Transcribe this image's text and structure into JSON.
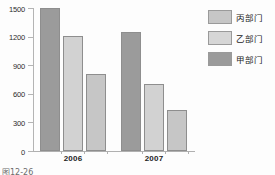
{
  "chart_data": {
    "type": "bar",
    "title": "",
    "xlabel": "",
    "ylabel": "",
    "categories": [
      "2006",
      "2007"
    ],
    "ylim": [
      0,
      1500
    ],
    "yticks": [
      0,
      300,
      600,
      900,
      1200,
      1500
    ],
    "grid": false,
    "legend_position": "right",
    "series": [
      {
        "name": "甲部门",
        "values": [
          1500,
          1250
        ],
        "color": "#9b9b9b"
      },
      {
        "name": "乙部门",
        "values": [
          1210,
          700
        ],
        "color": "#d2d2d2"
      },
      {
        "name": "丙部门",
        "values": [
          810,
          430
        ],
        "color": "#c6c6c6"
      }
    ],
    "series_draw_order": [
      "甲部门",
      "乙部门",
      "丙部门"
    ]
  },
  "axis": {
    "y_labels": [
      "1500",
      "1200",
      "900",
      "600",
      "300",
      "0"
    ],
    "x_labels": [
      "2006",
      "2007"
    ]
  },
  "legend": {
    "items": [
      {
        "label": "丙部门",
        "color": "#c6c6c6"
      },
      {
        "label": "乙部门",
        "color": "#d6d6d6"
      },
      {
        "label": "甲部门",
        "color": "#9b9b9b"
      }
    ]
  },
  "caption": {
    "text": "图12-26"
  },
  "colors": {
    "bar_dark": "#9b9b9b",
    "bar_light": "#d2d2d2",
    "bar_mid": "#c6c6c6",
    "shadow": "#131313",
    "axis": "#b4b4b4"
  }
}
